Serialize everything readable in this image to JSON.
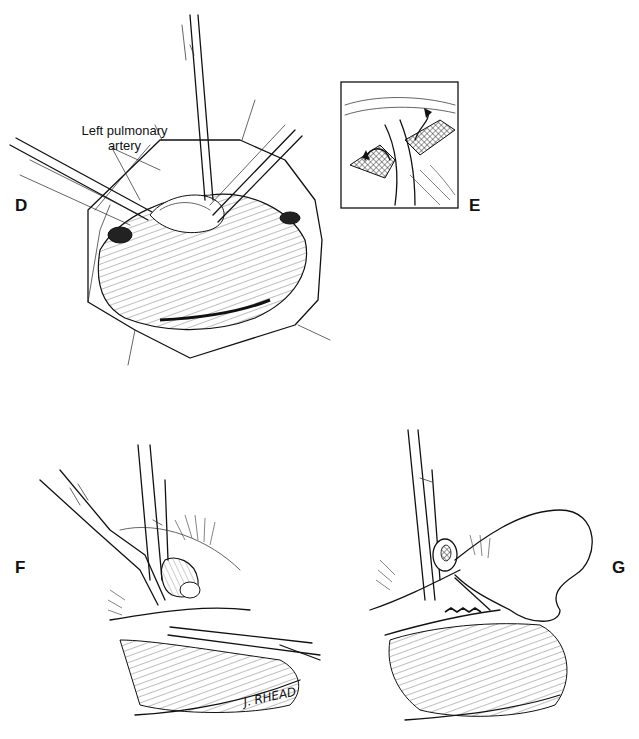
{
  "figure": {
    "panels": [
      {
        "id": "D",
        "label": "D",
        "annotation": "Left pulmonary artery"
      },
      {
        "id": "E",
        "label": "E"
      },
      {
        "id": "F",
        "label": "F",
        "signature": "J. RHEAD"
      },
      {
        "id": "G",
        "label": "G"
      }
    ],
    "annotation_lines": [
      "Left pulmonary",
      "artery"
    ]
  }
}
